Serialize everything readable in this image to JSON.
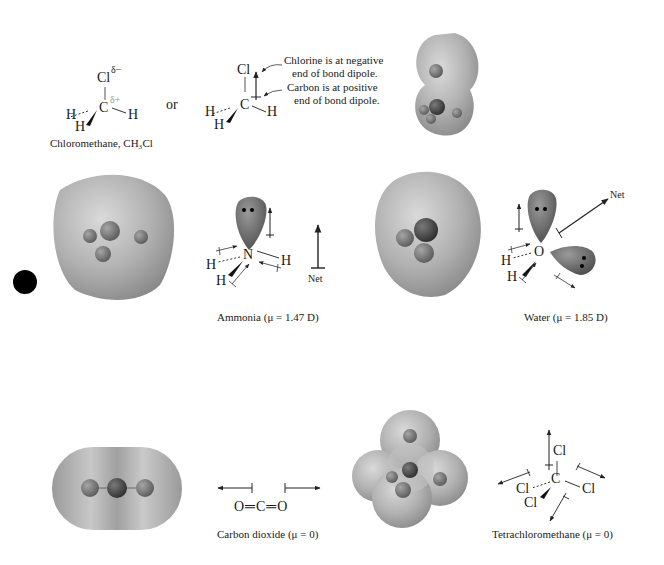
{
  "panels": {
    "chloromethane": {
      "caption": "Chloromethane, CH₃Cl",
      "atoms": {
        "cl": "Cl",
        "c": "C",
        "h1": "H",
        "h2": "H",
        "h3": "H"
      },
      "partial_neg": "δ−",
      "partial_pos": "δ+",
      "or_label": "or",
      "alt": {
        "atoms": {
          "cl": "Cl",
          "c": "C",
          "h1": "H",
          "h2": "H",
          "h3": "H"
        },
        "note_chlorine": [
          "Chlorine is at negative",
          "end of bond dipole."
        ],
        "note_carbon": [
          "Carbon is at positive",
          "end of bond dipole."
        ]
      }
    },
    "ammonia": {
      "caption": "Ammonia (μ = 1.47 D)",
      "atoms": {
        "n": "N",
        "h1": "H",
        "h2": "H",
        "h3": "H"
      },
      "net_label": "Net"
    },
    "water": {
      "caption": "Water (μ = 1.85 D)",
      "atoms": {
        "o": "O",
        "h1": "H",
        "h2": "H"
      },
      "net_label": "Net"
    },
    "carbon_dioxide": {
      "caption": "Carbon dioxide (μ = 0)",
      "formula": "O═C═O"
    },
    "tetrachloromethane": {
      "caption": "Tetrachloromethane (μ = 0)",
      "atoms": {
        "c": "C",
        "cl_top": "Cl",
        "cl_left": "Cl",
        "cl_right": "Cl",
        "cl_front": "Cl"
      }
    }
  },
  "colors": {
    "surface": "#a8a8a8",
    "surface_light": "#d2d2d2",
    "atom_dark": "#4a4a4a",
    "atom_mid": "#7a7a7a",
    "lone_pair": "#6e6e6e",
    "marker": "#000000",
    "text": "#1a1a1a"
  }
}
